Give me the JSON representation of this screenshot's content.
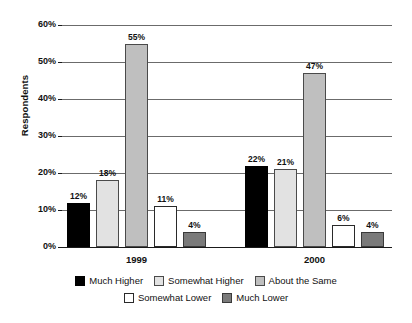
{
  "chart_data": {
    "type": "bar",
    "title": "",
    "subtitle": "",
    "xlabel": "",
    "ylabel": "Respondents",
    "categories": [
      "1999",
      "2000"
    ],
    "series": [
      {
        "name": "Much Higher",
        "key": "much-higher",
        "color": "#000000",
        "values": [
          12,
          22
        ],
        "labels": [
          "12%",
          "22%"
        ]
      },
      {
        "name": "Somewhat Higher",
        "key": "somewhat-higher",
        "color": "#e2e2e2",
        "values": [
          18,
          21
        ],
        "labels": [
          "18%",
          "21%"
        ]
      },
      {
        "name": "About the Same",
        "key": "about-same",
        "color": "#bfbfbf",
        "values": [
          55,
          47
        ],
        "labels": [
          "55%",
          "47%"
        ]
      },
      {
        "name": "Somewhat Lower",
        "key": "somewhat-lower",
        "color": "#ffffff",
        "values": [
          11,
          6
        ],
        "labels": [
          "11%",
          "6%"
        ]
      },
      {
        "name": "Much Lower",
        "key": "much-lower",
        "color": "#7a7a7a",
        "values": [
          4,
          4
        ],
        "labels": [
          "4%",
          "4%"
        ]
      }
    ],
    "ylim": [
      0,
      60
    ],
    "ytick_values": [
      0,
      10,
      20,
      30,
      40,
      50,
      60
    ],
    "ytick_labels": [
      "0%",
      "10%",
      "20%",
      "30%",
      "40%",
      "50%",
      "60%"
    ],
    "grid": true,
    "grid_axis": "y",
    "legend_position": "bottom",
    "legend_rows": [
      [
        "Much Higher",
        "Somewhat Higher",
        "About the Same"
      ],
      [
        "Somewhat Lower",
        "Much Lower"
      ]
    ]
  },
  "axis": {
    "y_title": "Respondents",
    "ticks": [
      "0%",
      "10%",
      "20%",
      "30%",
      "40%",
      "50%",
      "60%"
    ]
  },
  "categories": [
    "1999",
    "2000"
  ],
  "legend": {
    "row1": [
      {
        "label": "Much Higher",
        "key": "much-higher"
      },
      {
        "label": "Somewhat Higher",
        "key": "somewhat-higher"
      },
      {
        "label": "About the Same",
        "key": "about-same"
      }
    ],
    "row2": [
      {
        "label": "Somewhat Lower",
        "key": "somewhat-lower"
      },
      {
        "label": "Much Lower",
        "key": "much-lower"
      }
    ]
  }
}
